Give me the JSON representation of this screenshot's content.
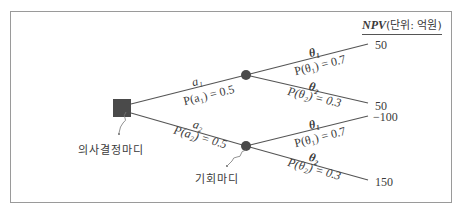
{
  "header": {
    "npv_label": "NPV",
    "unit_label": "(단위: 억원)"
  },
  "nodes": {
    "decision_node_label": "의사결정마디",
    "chance_node_label": "기회마디"
  },
  "branches": {
    "a1": {
      "name": "a₁",
      "prob": "P(a₁) = 0.5"
    },
    "a2": {
      "name": "a₂",
      "prob": "P(a₂) = 0.5"
    },
    "upper_theta1": {
      "name": "θ₁",
      "prob": "P(θ₁) = 0.7"
    },
    "upper_theta2": {
      "name": "θ₂",
      "prob": "P(θ₂) = 0.3"
    },
    "lower_theta1": {
      "name": "θ₁",
      "prob": "P(θ₁) = 0.7"
    },
    "lower_theta2": {
      "name": "θ₂",
      "prob": "P(θ₂) = 0.3"
    }
  },
  "outcomes": [
    "50",
    "50",
    "−100",
    "150"
  ],
  "colors": {
    "line": "#555555",
    "node": "#4a4a4a",
    "frame": "#9a9a9a"
  }
}
